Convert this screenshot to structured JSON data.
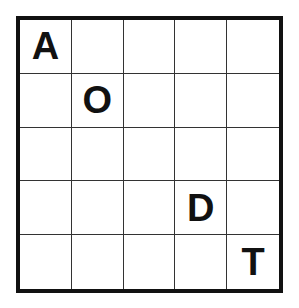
{
  "puzzle": {
    "rows": 5,
    "cols": 5,
    "grid": [
      [
        "A",
        "",
        "",
        "",
        ""
      ],
      [
        "",
        "O",
        "",
        "",
        ""
      ],
      [
        "",
        "",
        "",
        "",
        ""
      ],
      [
        "",
        "",
        "",
        "D",
        ""
      ],
      [
        "",
        "",
        "",
        "",
        "T"
      ]
    ]
  },
  "colors": {
    "border": "#111111",
    "gridline": "#333333",
    "letter": "#111111",
    "background": "#ffffff"
  }
}
